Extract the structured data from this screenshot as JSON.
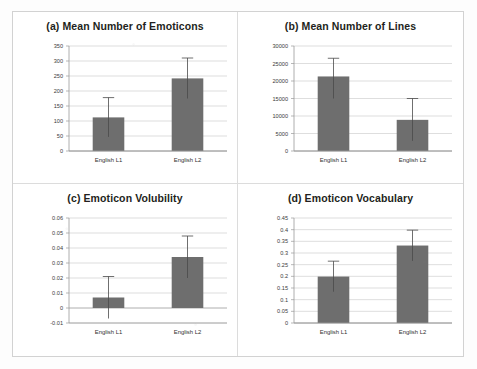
{
  "figure": {
    "background_color": "#fdfdfd",
    "panel_border_color": "#d2d2d2",
    "bar_color": "#6e6e6e",
    "error_bar_color": "#4a4a4a",
    "gridline_color": "#c8c8c8"
  },
  "chart_data": [
    {
      "type": "bar",
      "panel": "a",
      "title": "(a) Mean Number of Emoticons",
      "xlabel": "",
      "ylabel": "",
      "categories": [
        "English L1",
        "English L2"
      ],
      "values": [
        112,
        242
      ],
      "errors_low": [
        47,
        175
      ],
      "errors_high": [
        178,
        310
      ],
      "ylim": [
        0,
        350
      ],
      "yticks": [
        0,
        50,
        100,
        150,
        200,
        250,
        300,
        350
      ],
      "ytick_labels": [
        "0",
        "50",
        "100",
        "150",
        "200",
        "250",
        "300",
        "350"
      ],
      "grid": true,
      "legend": false
    },
    {
      "type": "bar",
      "panel": "b",
      "title": "(b) Mean Number of Lines",
      "xlabel": "",
      "ylabel": "",
      "categories": [
        "English L1",
        "English L2"
      ],
      "values": [
        21300,
        8900
      ],
      "errors_low": [
        15000,
        2900
      ],
      "errors_high": [
        26500,
        15000
      ],
      "ylim": [
        0,
        30000
      ],
      "yticks": [
        0,
        5000,
        10000,
        15000,
        20000,
        25000,
        30000
      ],
      "ytick_labels": [
        "0",
        "5000",
        "10000",
        "15000",
        "20000",
        "25000",
        "30000"
      ],
      "grid": true,
      "legend": false
    },
    {
      "type": "bar",
      "panel": "c",
      "title": "(c) Emoticon Volubility",
      "xlabel": "",
      "ylabel": "",
      "categories": [
        "English L1",
        "English L2"
      ],
      "values": [
        0.007,
        0.034
      ],
      "errors_low": [
        -0.007,
        0.02
      ],
      "errors_high": [
        0.021,
        0.048
      ],
      "ylim": [
        -0.01,
        0.06
      ],
      "yticks": [
        -0.01,
        0,
        0.01,
        0.02,
        0.03,
        0.04,
        0.05,
        0.06
      ],
      "ytick_labels": [
        "-0.01",
        "0",
        "0.01",
        "0.02",
        "0.03",
        "0.04",
        "0.05",
        "0.06"
      ],
      "grid": true,
      "legend": false
    },
    {
      "type": "bar",
      "panel": "d",
      "title": "(d) Emoticon Vocabulary",
      "xlabel": "",
      "ylabel": "",
      "categories": [
        "English L1",
        "English L2"
      ],
      "values": [
        0.199,
        0.332
      ],
      "errors_low": [
        0.134,
        0.266
      ],
      "errors_high": [
        0.265,
        0.398
      ],
      "ylim": [
        0,
        0.45
      ],
      "yticks": [
        0,
        0.05,
        0.1,
        0.15,
        0.2,
        0.25,
        0.3,
        0.35,
        0.4,
        0.45
      ],
      "ytick_labels": [
        "0",
        "0.05",
        "0.1",
        "0.15",
        "0.2",
        "0.25",
        "0.3",
        "0.35",
        "0.4",
        "0.45"
      ],
      "grid": true,
      "legend": false
    }
  ]
}
